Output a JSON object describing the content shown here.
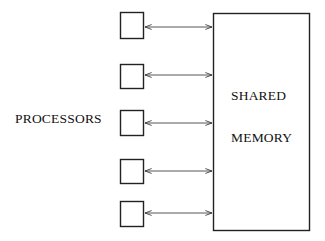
{
  "diagram": {
    "type": "block-diagram",
    "labels": {
      "processors": "PROCESSORS",
      "memory_line1": "SHARED",
      "memory_line2": "MEMORY"
    },
    "processors": [
      {
        "id": "p1",
        "x": 120,
        "y": 12,
        "w": 24,
        "h": 27,
        "arrow_y": 27
      },
      {
        "id": "p2",
        "x": 120,
        "y": 64,
        "w": 24,
        "h": 24,
        "arrow_y": 75
      },
      {
        "id": "p3",
        "x": 120,
        "y": 110,
        "w": 24,
        "h": 25,
        "arrow_y": 123
      },
      {
        "id": "p4",
        "x": 120,
        "y": 159,
        "w": 24,
        "h": 24,
        "arrow_y": 171
      },
      {
        "id": "p5",
        "x": 120,
        "y": 201,
        "w": 24,
        "h": 25,
        "arrow_y": 213
      }
    ],
    "memory": {
      "x": 213,
      "y": 13,
      "w": 97,
      "h": 218
    },
    "connections": [
      {
        "from": "p1",
        "to": "memory",
        "style": "bidirectional-arrow"
      },
      {
        "from": "p2",
        "to": "memory",
        "style": "bidirectional-arrow"
      },
      {
        "from": "p3",
        "to": "memory",
        "style": "bidirectional-arrow"
      },
      {
        "from": "p4",
        "to": "memory",
        "style": "bidirectional-arrow"
      },
      {
        "from": "p5",
        "to": "memory",
        "style": "bidirectional-arrow"
      }
    ],
    "colors": {
      "stroke": "#222222",
      "background": "#ffffff"
    }
  }
}
